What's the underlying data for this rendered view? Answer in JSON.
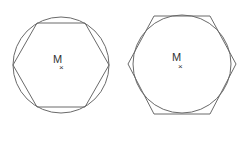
{
  "figures": [
    {
      "id": "inscribed-hexagon",
      "description": "Regular hexagon inscribed in a circle",
      "center_label": "M",
      "center_marker": "×",
      "circle": {
        "cx": 61,
        "cy": 65,
        "r": 48
      },
      "hexagon_points": "13,65 37,23 85,23 109,65 85,107 37,107"
    },
    {
      "id": "circumscribed-hexagon",
      "description": "Circle inscribed in a regular hexagon",
      "center_label": "M",
      "center_marker": "×",
      "circle": {
        "cx": 182,
        "cy": 64,
        "r": 50
      },
      "hexagon_points": "128,64 154,16 210,16 236,64 210,114 154,114"
    }
  ],
  "colors": {
    "stroke": "#6a6a6a",
    "background": "#ffffff"
  }
}
